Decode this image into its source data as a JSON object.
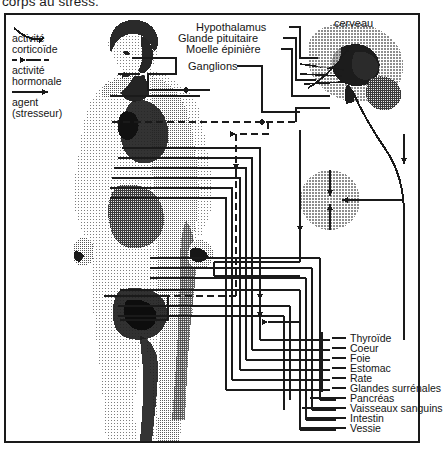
{
  "caption": "corps au stress.",
  "figure": {
    "title_region": "diagramme de la reponse au stress",
    "brain_label": "cerveau"
  },
  "legend": {
    "items": [
      {
        "line_style": "wavy-arrow",
        "label_line1": "activité",
        "label_line2": "corticoïde"
      },
      {
        "line_style": "dashed-arrow",
        "label_line1": "activité",
        "label_line2": "hormonale"
      },
      {
        "line_style": "solid-arrow",
        "label_line1": "agent",
        "label_line2": "(stresseur)"
      }
    ]
  },
  "callouts": [
    {
      "name": "hypothalamus",
      "text": "Hypothalamus"
    },
    {
      "name": "glande-pituitaire",
      "text": "Glande pituitaire"
    },
    {
      "name": "moelle-epiniere",
      "text": "Moelle épinière"
    },
    {
      "name": "ganglions",
      "text": "Ganglions"
    }
  ],
  "organs": [
    {
      "name": "thyroide",
      "text": "Thyroïde"
    },
    {
      "name": "coeur",
      "text": "Coeur"
    },
    {
      "name": "foie",
      "text": "Foie"
    },
    {
      "name": "estomac",
      "text": "Estomac"
    },
    {
      "name": "rate",
      "text": "Rate"
    },
    {
      "name": "glandes-surrenales",
      "text": "Glandes surrénales"
    },
    {
      "name": "pancreas",
      "text": "Pancréas"
    },
    {
      "name": "vaisseaux-sanguins",
      "text": "Vaisseaux sanguins"
    },
    {
      "name": "intestin",
      "text": "Intestin"
    },
    {
      "name": "vessie",
      "text": "Vessie"
    }
  ],
  "colors": {
    "ink": "#1a1a1a",
    "paper": "#ffffff",
    "halftone_light": "#c9c9c9",
    "halftone_mid": "#9a9a9a",
    "halftone_dark": "#4a4a4a",
    "highlight_circle": "#a8a8a8"
  }
}
